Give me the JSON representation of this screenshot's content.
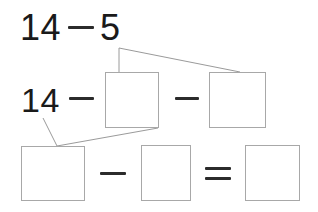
{
  "worksheet": {
    "type": "math-decomposition-diagram",
    "ink_color": "#1a1a1a",
    "box_border_color": "#a8a8a8",
    "connector_color": "#9a9a9a",
    "background_color": "#ffffff",
    "rows": {
      "row1": {
        "label": "original-expression",
        "expression": "14 − 5",
        "minuend": "14",
        "operator": "−",
        "subtrahend": "5"
      },
      "row2": {
        "label": "decomposed-expression",
        "minuend": "14",
        "operator_1": "−",
        "box_1_value": "",
        "operator_2": "−",
        "box_2_value": ""
      },
      "row3": {
        "label": "answer-expression",
        "box_1_value": "",
        "operator_1": "−",
        "box_2_value": "",
        "operator_2": "=",
        "box_3_value": ""
      }
    },
    "boxes": [
      {
        "name": "row2-box-1",
        "value": "",
        "x": 105,
        "y": 72,
        "w": 54,
        "h": 56
      },
      {
        "name": "row2-box-2",
        "value": "",
        "x": 209,
        "y": 72,
        "w": 57,
        "h": 56
      },
      {
        "name": "row3-box-1",
        "value": "",
        "x": 21,
        "y": 146,
        "w": 64,
        "h": 55
      },
      {
        "name": "row3-box-2",
        "value": "",
        "x": 141,
        "y": 145,
        "w": 50,
        "h": 56
      },
      {
        "name": "row3-box-3",
        "value": "",
        "x": 245,
        "y": 145,
        "w": 55,
        "h": 56
      }
    ],
    "connectors": [
      {
        "name": "five-to-row2-boxes",
        "from": "digit-5",
        "points": "119,72 119,48 240,72"
      },
      {
        "name": "fourteen-to-row3-box",
        "from": "digit-14",
        "points": "43,118 57,146 158,128"
      }
    ]
  }
}
